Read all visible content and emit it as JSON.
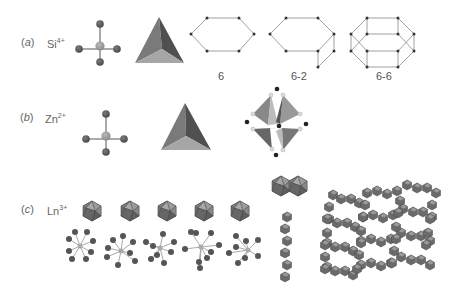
{
  "rows": [
    {
      "id": "a",
      "label": "(a)",
      "label_letter": "a",
      "ion_symbol": "Si",
      "ion_charge": "4+",
      "ring_captions": [
        "6",
        "6-2",
        "6-6"
      ]
    },
    {
      "id": "b",
      "label": "(b)",
      "label_letter": "b",
      "ion_symbol": "Zn",
      "ion_charge": "2+"
    },
    {
      "id": "c",
      "label": "(c)",
      "label_letter": "c",
      "ion_symbol": "Ln",
      "ion_charge": "3+",
      "polyhedra_count": 5
    }
  ],
  "colors": {
    "dark_atom": "#555555",
    "center_atom": "#9a9a9a",
    "bond": "#aaaaaa",
    "tetra_left": "#7a7a7a",
    "tetra_right": "#505050",
    "tetra_bottom": "#a5a5a5",
    "ring_line": "#888888",
    "ring_node": "#333333"
  }
}
